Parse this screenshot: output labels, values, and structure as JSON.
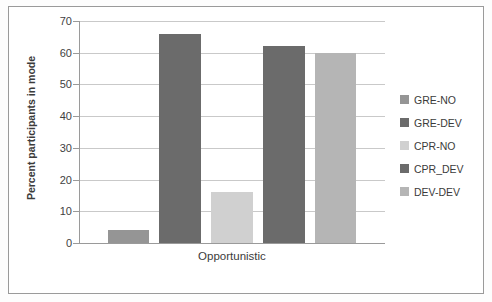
{
  "chart_data": {
    "type": "bar",
    "title": "",
    "xlabel": "",
    "ylabel": "Percent participants in mode",
    "categories": [
      "Opportunistic"
    ],
    "series": [
      {
        "name": "GRE-NO",
        "values": [
          4
        ],
        "color": "#959595"
      },
      {
        "name": "GRE-DEV",
        "values": [
          66
        ],
        "color": "#6b6b6b"
      },
      {
        "name": "CPR-NO",
        "values": [
          16
        ],
        "color": "#d0d0d0"
      },
      {
        "name": "CPR_DEV",
        "values": [
          62
        ],
        "color": "#6b6b6b"
      },
      {
        "name": "DEV-DEV",
        "values": [
          60
        ],
        "color": "#b5b5b5"
      }
    ],
    "ylim": [
      0,
      70
    ],
    "ytick_step": 10,
    "yticks": [
      0,
      10,
      20,
      30,
      40,
      50,
      60,
      70
    ],
    "ytick_labels": [
      "0",
      "10",
      "20",
      "30",
      "40",
      "50",
      "60",
      "70"
    ],
    "grid": true,
    "grid_axis": "y",
    "legend_position": "right",
    "legend_entries": [
      "GRE-NO",
      "GRE-DEV",
      "CPR-NO",
      "CPR_DEV",
      "DEV-DEV"
    ]
  },
  "axes": {
    "y_title": "Percent participants in mode",
    "x_category_label": "Opportunistic"
  },
  "colors": {
    "frame_border": "#9a9a9a",
    "gridline": "#c9c9c9",
    "axis": "#9a9a9a",
    "text": "#3b3b3b",
    "plot_background": "#ffffff"
  }
}
